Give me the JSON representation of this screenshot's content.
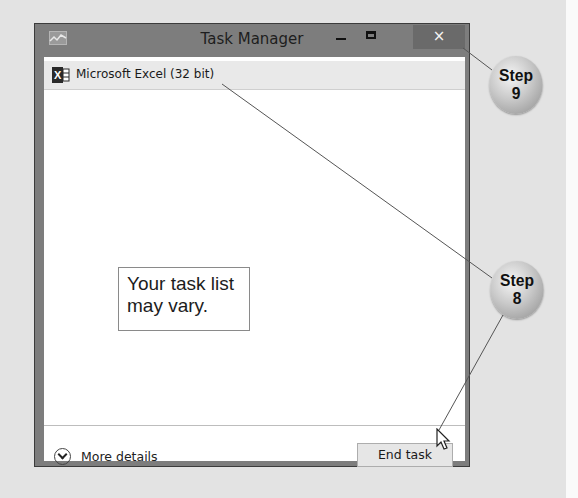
{
  "window": {
    "title": "Task Manager",
    "controls": {
      "minimize": "minimize",
      "maximize": "maximize",
      "close": "×"
    },
    "tasks": [
      {
        "icon": "excel-icon",
        "label": "Microsoft Excel (32 bit)"
      }
    ],
    "footer": {
      "more_details_label": "More details",
      "end_task_label": "End task"
    }
  },
  "annotations": {
    "note_line1": "Your task list",
    "note_line2": "may vary.",
    "step9": {
      "word": "Step",
      "number": "9"
    },
    "step8": {
      "word": "Step",
      "number": "8"
    }
  },
  "colors": {
    "frame": "#7d7d7d",
    "close_button": "#6a6a6a",
    "task_row": "#e9e9e9",
    "background": "#e3e3e3"
  }
}
